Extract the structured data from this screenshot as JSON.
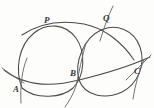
{
  "figure": {
    "background_color": "#fdfdfc",
    "ink_color": "#4a4a4a",
    "width": 154,
    "height": 108
  },
  "labels": [
    {
      "id": "label-p",
      "text": "P",
      "x": 44,
      "y": 16,
      "role": "upper-left-intersection"
    },
    {
      "id": "label-q",
      "text": "Q",
      "x": 103,
      "y": 14,
      "role": "upper-right-intersection"
    },
    {
      "id": "label-a",
      "text": "A",
      "x": 13,
      "y": 85,
      "role": "baseline-left-point"
    },
    {
      "id": "label-b",
      "text": "B",
      "x": 70,
      "y": 69,
      "role": "baseline-middle-point"
    },
    {
      "id": "label-c",
      "text": "C",
      "x": 134,
      "y": 67,
      "role": "baseline-right-point"
    }
  ],
  "points": [
    {
      "name": "P",
      "x": 48,
      "y": 27
    },
    {
      "name": "Q",
      "x": 108,
      "y": 24
    },
    {
      "name": "A",
      "x": 21,
      "y": 81
    },
    {
      "name": "B",
      "x": 79,
      "y": 80
    },
    {
      "name": "C",
      "x": 140,
      "y": 77
    }
  ],
  "strokes": [
    {
      "id": "arc-left-circle",
      "note": "large left circle through P, A and B",
      "d": "M 22 88 C 15 70 18 46 34 33 C 47 22 66 24 76 38 C 86 52 85 76 73 88 C 62 98 36 100 22 88 Z"
    },
    {
      "id": "arc-right-circle",
      "note": "large right circle through Q, B and C",
      "d": "M 79 80 C 74 62 84 38 101 30 C 116 23 134 30 140 47 C 146 64 138 84 122 92 C 105 100 85 96 79 80 Z"
    },
    {
      "id": "arc-top-middle",
      "note": "wide shallow arc sweeping through P and Q across the top",
      "d": "M 22 35 C 40 23 62 20 84 24 C 104 28 122 42 134 60"
    },
    {
      "id": "arc-baseline",
      "note": "long low arc passing through A, B and C",
      "d": "M 4 70 C 22 84 48 88 79 80 C 108 73 130 66 150 57"
    },
    {
      "id": "arc-through-a-steep",
      "note": "steep short arc crossing the baseline at A",
      "d": "M 27 58 C 22 70 20 86 21 103"
    },
    {
      "id": "arc-through-b-steep",
      "note": "steep arc crossing through B and running to lower left",
      "d": "M 86 43 C 82 57 79 72 76 86 C 73 95 69 101 65 107"
    },
    {
      "id": "arc-through-q-steep",
      "note": "steep arc rising above Q toward the top edge",
      "d": "M 113 6 C 108 16 104 28 100 41"
    },
    {
      "id": "arc-through-c-steep",
      "note": "steep short arc crossing the baseline at C",
      "d": "M 144 60 C 139 72 135 85 133 99"
    },
    {
      "id": "arc-right-tail",
      "note": "short shallow arc tail at the far right above C",
      "d": "M 126 80 C 134 72 143 63 151 55"
    },
    {
      "id": "arc-left-tail",
      "note": "short shallow arc tail at the far left above A",
      "d": "M 2 68 C 9 73 16 78 24 83"
    }
  ]
}
